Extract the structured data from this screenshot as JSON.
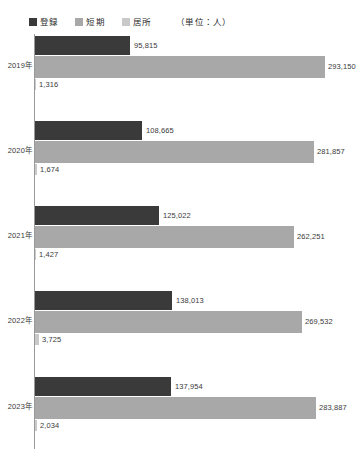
{
  "legend": {
    "entries": [
      {
        "label": "登録",
        "color": "#3a3a3a"
      },
      {
        "label": "短期",
        "color": "#a8a8a8"
      },
      {
        "label": "居所",
        "color": "#c9c9c9"
      }
    ],
    "unit_note": "（単位：人）"
  },
  "chart_data": {
    "type": "bar",
    "orientation": "horizontal",
    "grouped": true,
    "title": "",
    "subtitle": "",
    "xlabel": "",
    "ylabel": "",
    "unit": "人",
    "unit_note": "（単位：人）",
    "grid": false,
    "legend_position": "top-left",
    "categories": [
      "2019年",
      "2020年",
      "2021年",
      "2022年",
      "2023年"
    ],
    "xlim": [
      0,
      293150
    ],
    "series": [
      {
        "name": "登録",
        "color": "#3a3a3a",
        "values": [
          95815,
          108665,
          125022,
          138013,
          137954
        ],
        "labels": [
          "95,815",
          "108,665",
          "125,022",
          "138,013",
          "137,954"
        ]
      },
      {
        "name": "短期",
        "color": "#a8a8a8",
        "values": [
          293150,
          281857,
          262251,
          269532,
          283887
        ],
        "labels": [
          "293,150",
          "281,857",
          "262,251",
          "269,532",
          "283,887"
        ]
      },
      {
        "name": "居所",
        "color": "#c9c9c9",
        "values": [
          1316,
          1674,
          1427,
          3725,
          2034
        ],
        "labels": [
          "1,316",
          "1,674",
          "1,427",
          "3,725",
          "2,034"
        ]
      }
    ]
  }
}
